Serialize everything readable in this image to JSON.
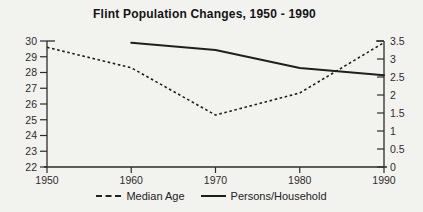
{
  "page": {
    "background": "#f2f2ef"
  },
  "chart_data": {
    "type": "line",
    "title": "Flint Population Changes, 1950 - 1990",
    "x_range": [
      1950,
      1990
    ],
    "x_ticks": [
      "1950",
      "1960",
      "1970",
      "1980",
      "1990"
    ],
    "left_axis": {
      "min": 22,
      "max": 30,
      "ticks": [
        22,
        23,
        24,
        25,
        26,
        27,
        28,
        29,
        30
      ],
      "labels": [
        "22",
        "23",
        "24",
        "25",
        "26",
        "27",
        "28",
        "29",
        "30"
      ]
    },
    "right_axis": {
      "min": 0,
      "max": 3.5,
      "ticks": [
        0,
        0.5,
        1,
        1.5,
        2,
        2.5,
        3,
        3.5
      ],
      "labels": [
        "0",
        "0.5",
        "1",
        "1.5",
        "2",
        "2.5",
        "3",
        "3.5"
      ]
    },
    "series": [
      {
        "name": "Median Age",
        "axis": "left",
        "line_style": "dashed",
        "x": [
          1950,
          1960,
          1970,
          1980,
          1990
        ],
        "values": [
          29.6,
          28.3,
          25.3,
          26.7,
          29.9
        ]
      },
      {
        "name": "Persons/Household",
        "axis": "right",
        "line_style": "solid",
        "x": [
          1960,
          1970,
          1980,
          1990
        ],
        "values": [
          3.45,
          3.25,
          2.75,
          2.55
        ]
      }
    ],
    "grid": false,
    "legend_position": "bottom",
    "colors": {
      "line": "#1f1f1f",
      "axis": "#2b2b2b",
      "text": "#2d2d2d",
      "title": "#141414",
      "background": "#f2f2ef"
    }
  }
}
